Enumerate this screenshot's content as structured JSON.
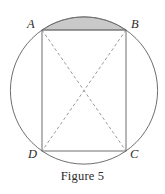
{
  "figure": {
    "caption": "Figure 5",
    "background_color": "#ffffff",
    "stroke_color": "#6e6e6e",
    "dashed_stroke_color": "#9a9a9a",
    "shaded_region_color": "#c9c9c9",
    "label_color": "#2b2b2b",
    "vertices": [
      {
        "name": "A",
        "label": "A",
        "x": 42,
        "y": 30
      },
      {
        "name": "B",
        "label": "B",
        "x": 126,
        "y": 30
      },
      {
        "name": "C",
        "label": "C",
        "x": 126,
        "y": 151
      },
      {
        "name": "D",
        "label": "D",
        "x": 42,
        "y": 151
      }
    ],
    "circle": {
      "cx": 84,
      "cy": 90.5,
      "r": 73.6
    },
    "rectangle": {
      "x": 42,
      "y": 30,
      "width": 84,
      "height": 121
    },
    "diagonals": [
      {
        "name": "diagonal-A-C",
        "from": "A",
        "to": "C",
        "style": "dashed"
      },
      {
        "name": "diagonal-B-D",
        "from": "B",
        "to": "D",
        "style": "dashed"
      }
    ],
    "shaded_region": {
      "name": "circular-segment-above-chord-AB",
      "description": "circular segment bounded by chord AB and the minor arc AB"
    }
  }
}
